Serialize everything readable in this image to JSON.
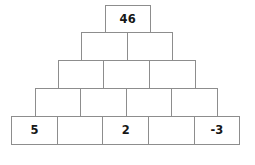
{
  "figure": {
    "name": "number-pyramid",
    "type": "number-pyramid-puzzle",
    "rows": 5,
    "colors": {
      "cell_fill": "#ffffff",
      "cell_border": "#8d8d8d",
      "text": "#171717",
      "background": "#ffffff"
    }
  },
  "pyramid": {
    "rows": [
      {
        "index": 1,
        "cells": [
          {
            "value": "46",
            "filled": true
          }
        ]
      },
      {
        "index": 2,
        "cells": [
          {
            "value": "",
            "filled": false
          },
          {
            "value": "",
            "filled": false
          }
        ]
      },
      {
        "index": 3,
        "cells": [
          {
            "value": "",
            "filled": false
          },
          {
            "value": "",
            "filled": false
          },
          {
            "value": "",
            "filled": false
          }
        ]
      },
      {
        "index": 4,
        "cells": [
          {
            "value": "",
            "filled": false
          },
          {
            "value": "",
            "filled": false
          },
          {
            "value": "",
            "filled": false
          },
          {
            "value": "",
            "filled": false
          }
        ]
      },
      {
        "index": 5,
        "cells": [
          {
            "value": "5",
            "filled": true
          },
          {
            "value": "",
            "filled": false
          },
          {
            "value": "2",
            "filled": true
          },
          {
            "value": "",
            "filled": false
          },
          {
            "value": "-3",
            "filled": true
          }
        ]
      }
    ]
  }
}
